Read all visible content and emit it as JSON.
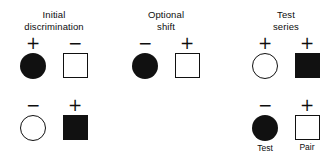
{
  "figure": {
    "background_color": "#ffffff",
    "ink_color": "#111111",
    "columns": [
      {
        "id": "initial-discrimination",
        "heading_line1": "Initial",
        "heading_line2": "discrimination",
        "rows": [
          {
            "id": "initial-discrimination-row-1",
            "cells": [
              {
                "sign": "+",
                "sign_name": "plus-sign",
                "shape": "circle-filled",
                "shape_name": "filled-circle",
                "label": ""
              },
              {
                "sign": "−",
                "sign_name": "minus-sign",
                "shape": "square-open",
                "shape_name": "open-square",
                "label": ""
              }
            ]
          },
          {
            "id": "initial-discrimination-row-2",
            "cells": [
              {
                "sign": "−",
                "sign_name": "minus-sign",
                "shape": "circle-open",
                "shape_name": "open-circle",
                "label": ""
              },
              {
                "sign": "+",
                "sign_name": "plus-sign",
                "shape": "square-filled",
                "shape_name": "filled-square",
                "label": ""
              }
            ]
          }
        ]
      },
      {
        "id": "optional-shift",
        "heading_line1": "Optional",
        "heading_line2": "shift",
        "rows": [
          {
            "id": "optional-shift-row-1",
            "cells": [
              {
                "sign": "−",
                "sign_name": "minus-sign",
                "shape": "circle-filled",
                "shape_name": "filled-circle",
                "label": ""
              },
              {
                "sign": "+",
                "sign_name": "plus-sign",
                "shape": "square-open",
                "shape_name": "open-square",
                "label": ""
              }
            ]
          },
          {
            "id": "optional-shift-row-2",
            "cells": []
          }
        ]
      },
      {
        "id": "test-series",
        "heading_line1": "Test",
        "heading_line2": "series",
        "rows": [
          {
            "id": "test-series-row-1",
            "cells": [
              {
                "sign": "+",
                "sign_name": "plus-sign",
                "shape": "circle-open",
                "shape_name": "open-circle",
                "label": ""
              },
              {
                "sign": "+",
                "sign_name": "plus-sign",
                "shape": "square-filled",
                "shape_name": "filled-square",
                "label": ""
              }
            ]
          },
          {
            "id": "test-series-row-2",
            "cells": [
              {
                "sign": "−",
                "sign_name": "minus-sign",
                "shape": "circle-filled",
                "shape_name": "filled-circle",
                "label": "Test"
              },
              {
                "sign": "+",
                "sign_name": "plus-sign",
                "shape": "square-open",
                "shape_name": "open-square",
                "label": "Pair"
              }
            ]
          }
        ]
      }
    ]
  }
}
